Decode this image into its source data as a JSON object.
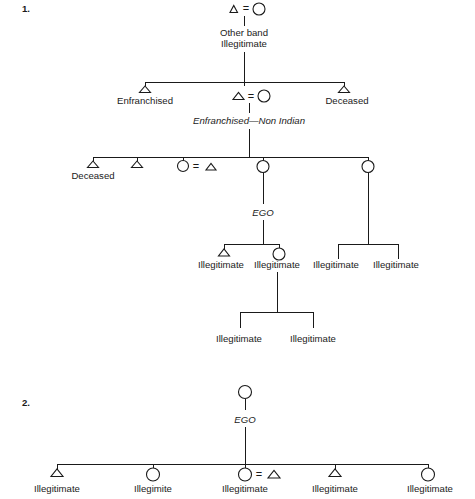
{
  "figure": {
    "background_color": "#ffffff",
    "line_color": "#1a1a1a",
    "symbols": {
      "male": "triangle",
      "female": "circle",
      "marriage": "="
    }
  },
  "diagrams": [
    {
      "number": "1.",
      "generations": [
        {
          "id": "gen1",
          "nodes": [
            {
              "id": "g1-male",
              "shape": "triangle",
              "label": ""
            },
            {
              "id": "g1-marriage",
              "shape": "equals",
              "label": "="
            },
            {
              "id": "g1-female",
              "shape": "circle",
              "label": ""
            }
          ],
          "notes": [
            "Other band",
            "Illegitimate"
          ]
        },
        {
          "id": "gen2",
          "nodes": [
            {
              "id": "g2-left-male",
              "shape": "triangle",
              "label": "Enfranchised"
            },
            {
              "id": "g2-mid-male",
              "shape": "triangle",
              "label": ""
            },
            {
              "id": "g2-mid-marriage",
              "shape": "equals",
              "label": "="
            },
            {
              "id": "g2-mid-female",
              "shape": "circle",
              "label": ""
            },
            {
              "id": "g2-right-male",
              "shape": "triangle",
              "label": "Deceased"
            }
          ],
          "notes": [
            "Enfranchised—Non Indian"
          ]
        },
        {
          "id": "gen3",
          "nodes": [
            {
              "id": "g3-male-1",
              "shape": "triangle",
              "label": "Deceased"
            },
            {
              "id": "g3-male-2",
              "shape": "triangle",
              "label": ""
            },
            {
              "id": "g3-female-3",
              "shape": "circle",
              "label": ""
            },
            {
              "id": "g3-marriage-3",
              "shape": "equals",
              "label": "="
            },
            {
              "id": "g3-male-3-spouse",
              "shape": "triangle",
              "label": ""
            },
            {
              "id": "g3-female-ego",
              "shape": "circle",
              "label": "EGO"
            },
            {
              "id": "g3-female-5",
              "shape": "circle",
              "label": ""
            }
          ]
        },
        {
          "id": "gen4",
          "nodes": [
            {
              "id": "g4-male-a",
              "shape": "triangle",
              "label": "Illegitimate"
            },
            {
              "id": "g4-female-b",
              "shape": "circle",
              "label": "Illegitimate"
            },
            {
              "id": "g4-plain-c",
              "shape": "none",
              "label": "Illegitimate"
            },
            {
              "id": "g4-plain-d",
              "shape": "none",
              "label": "Illegitimate"
            }
          ]
        },
        {
          "id": "gen5",
          "nodes": [
            {
              "id": "g5-plain-a",
              "shape": "none",
              "label": "Illegitimate"
            },
            {
              "id": "g5-plain-b",
              "shape": "none",
              "label": "Illegitimate"
            }
          ]
        }
      ]
    },
    {
      "number": "2.",
      "generations": [
        {
          "id": "d2-gen1",
          "nodes": [
            {
              "id": "d2-ego",
              "shape": "circle",
              "label": "EGO"
            }
          ]
        },
        {
          "id": "d2-gen2",
          "nodes": [
            {
              "id": "d2-child-1",
              "shape": "triangle",
              "label": "Illegitimate"
            },
            {
              "id": "d2-child-2",
              "shape": "circle",
              "label": "Illegimite"
            },
            {
              "id": "d2-child-3",
              "shape": "circle",
              "label": "Illegitimate"
            },
            {
              "id": "d2-child-3-marriage",
              "shape": "equals",
              "label": "="
            },
            {
              "id": "d2-child-3-spouse",
              "shape": "triangle",
              "label": ""
            },
            {
              "id": "d2-child-4",
              "shape": "triangle",
              "label": "Illegitimate"
            },
            {
              "id": "d2-child-5",
              "shape": "circle",
              "label": "Illegitimate"
            }
          ]
        }
      ]
    }
  ],
  "labels": {
    "diagram1_number": "1.",
    "diagram2_number": "2.",
    "other_band": "Other band",
    "illegitimate": "Illegitimate",
    "illegimite_typo": "Illegimite",
    "enfranchised": "Enfranchised",
    "deceased": "Deceased",
    "enfranchised_non_indian": "Enfranchised—Non Indian",
    "ego": "EGO",
    "equals": "="
  }
}
